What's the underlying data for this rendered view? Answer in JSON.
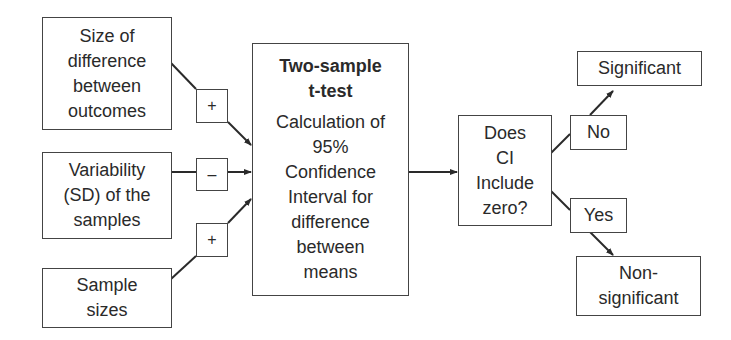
{
  "diagram": {
    "inputs": [
      {
        "lines": [
          "Size of",
          "difference",
          "between",
          "outcomes"
        ],
        "effect": "+"
      },
      {
        "lines": [
          "Variability",
          "(SD) of the",
          "samples"
        ],
        "effect": "–"
      },
      {
        "lines": [
          "Sample",
          "sizes"
        ],
        "effect": "+"
      }
    ],
    "test": {
      "title_lines": [
        "Two-sample",
        "t-test"
      ],
      "body_lines": [
        "Calculation of",
        "95%",
        "Confidence",
        "Interval for",
        "difference",
        "between",
        "means"
      ]
    },
    "decision": {
      "lines": [
        "Does",
        "CI",
        "Include",
        "zero?"
      ]
    },
    "branches": [
      {
        "label": "No",
        "outcome_lines": [
          "Significant"
        ]
      },
      {
        "label": "Yes",
        "outcome_lines": [
          "Non-",
          "significant"
        ]
      }
    ],
    "colors": {
      "line": "#2a2a2a",
      "border": "#444444",
      "background": "#ffffff"
    }
  }
}
